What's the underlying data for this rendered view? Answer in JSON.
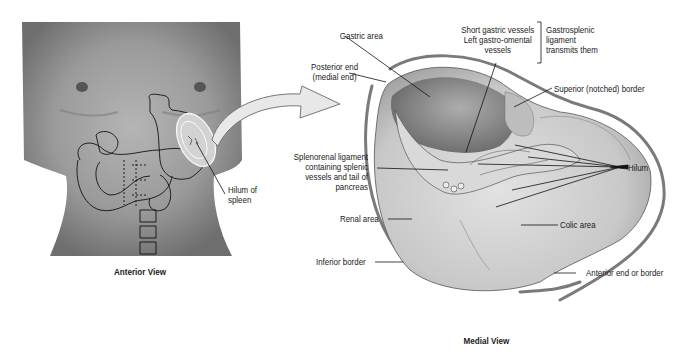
{
  "figure": {
    "views": [
      {
        "id": "anterior",
        "caption": "Anterior View"
      },
      {
        "id": "medial",
        "caption": "Medial View"
      }
    ]
  },
  "anterior_view": {
    "caption": "Anterior View",
    "labels": {
      "hilum_line1": "Hilum of",
      "hilum_line2": "spleen"
    }
  },
  "medial_view": {
    "caption": "Medial View",
    "labels": {
      "gastric_area": "Gastric area",
      "posterior_end_line1": "Posterior end",
      "posterior_end_line2": "(medial end)",
      "short_gastric_line1": "Short gastric vessels",
      "short_gastric_line2": "Left gastro-omental",
      "short_gastric_line3": "vessels",
      "gastrosplenic_line1": "Gastrosplenic",
      "gastrosplenic_line2": "ligament",
      "gastrosplenic_line3": "transmits them",
      "superior_border": "Superior (notched) border",
      "splenorenal_line1": "Splenorenal ligament",
      "splenorenal_line2": "containing splenic",
      "splenorenal_line3": "vessels and tail of",
      "splenorenal_line4": "pancreas",
      "hilum": "Hilum",
      "renal_area": "Renal area",
      "colic_area": "Colic area",
      "inferior_border": "Inferior border",
      "anterior_end": "Anterior end or border"
    }
  },
  "colors": {
    "background": "#ffffff",
    "text": "#1a1a1a",
    "torso": "#8f8f8f",
    "spleen_fill": "#c9c9c9",
    "border_line": "#7a7a7a",
    "arrow_fill": "#e6e6e6"
  }
}
